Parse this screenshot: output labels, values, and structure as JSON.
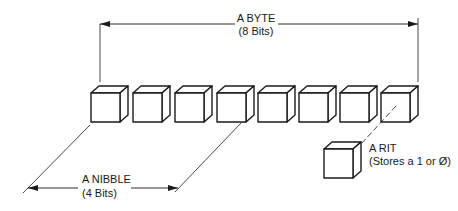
{
  "diagram": {
    "type": "byte-nibble-bit illustration",
    "byte": {
      "label": "A BYTE",
      "sublabel": "(8 Bits)",
      "bit_count": 8
    },
    "nibble": {
      "label": "A NIBBLE",
      "sublabel": "(4 Bits)",
      "bit_count": 4
    },
    "bit": {
      "label": "A RIT",
      "sublabel": "(Stores a 1 or Ø)"
    },
    "cubes": [
      {
        "index": 1,
        "x": 91
      },
      {
        "index": 2,
        "x": 133
      },
      {
        "index": 3,
        "x": 175
      },
      {
        "index": 4,
        "x": 217
      },
      {
        "index": 5,
        "x": 258
      },
      {
        "index": 6,
        "x": 299
      },
      {
        "index": 7,
        "x": 340
      },
      {
        "index": 8,
        "x": 381
      }
    ],
    "colors": {
      "ink": "#1a1a1a",
      "background": "#ffffff"
    }
  }
}
